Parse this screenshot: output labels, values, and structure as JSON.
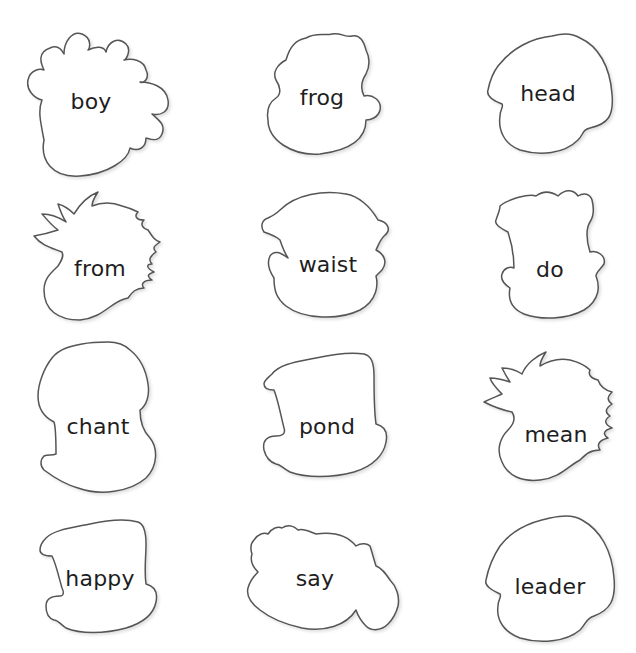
{
  "worksheet": {
    "cards": [
      {
        "word": "boy",
        "shape": "curly-bumps-head"
      },
      {
        "word": "frog",
        "shape": "wavy-hair-head"
      },
      {
        "word": "head",
        "shape": "round-head"
      },
      {
        "word": "from",
        "shape": "spiky-hair-head"
      },
      {
        "word": "waist",
        "shape": "bandana-head"
      },
      {
        "word": "do",
        "shape": "flat-top-head"
      },
      {
        "word": "chant",
        "shape": "tall-curly-head"
      },
      {
        "word": "pond",
        "shape": "top-hat-head"
      },
      {
        "word": "mean",
        "shape": "spiky-hair-head"
      },
      {
        "word": "happy",
        "shape": "top-hat-head"
      },
      {
        "word": "say",
        "shape": "fluffy-cloud-head"
      },
      {
        "word": "leader",
        "shape": "round-head"
      }
    ]
  },
  "colors": {
    "outline": "#555555",
    "text": "#1e1e1e",
    "background": "#ffffff"
  }
}
